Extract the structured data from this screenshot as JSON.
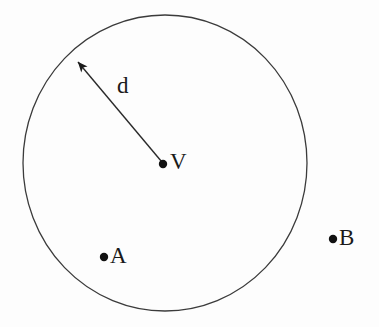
{
  "figure": {
    "type": "geometry-diagram",
    "canvas": {
      "width": 379,
      "height": 327
    },
    "background_color": "#fdfdfd",
    "ink_color": "#1a1a1a",
    "stroke_color": "#3b3b3b"
  },
  "circle": {
    "name": "boundary-circle",
    "center_x": 165,
    "center_y": 163,
    "radius_x": 142,
    "radius_y": 148,
    "stroke_width": 1.3,
    "fill": "none"
  },
  "radius_arrow": {
    "name": "radius-arrow",
    "from_x": 163,
    "from_y": 163,
    "to_x": 75,
    "to_y": 58,
    "stroke_width": 1.4,
    "label": "d",
    "label_x": 123,
    "label_y": 88
  },
  "points": [
    {
      "id": "V",
      "label": "V",
      "x": 163,
      "y": 164,
      "dot_radius": 4.2,
      "label_x": 172,
      "label_y": 164,
      "position_note": "center of circle"
    },
    {
      "id": "A",
      "label": "A",
      "x": 104,
      "y": 257,
      "dot_radius": 4.2,
      "label_x": 112,
      "label_y": 257,
      "position_note": "inside circle"
    },
    {
      "id": "B",
      "label": "B",
      "x": 333,
      "y": 239,
      "dot_radius": 4.2,
      "label_x": 341,
      "label_y": 239,
      "position_note": "outside circle"
    }
  ]
}
